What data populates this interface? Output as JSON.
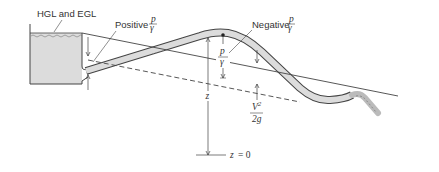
{
  "diagram": {
    "type": "siphon-hgl-egl",
    "colors": {
      "line": "#444444",
      "fluid_fill": "#dcdcdc",
      "background": "#ffffff"
    },
    "labels": {
      "hgl_egl": "HGL and EGL",
      "positive": "Positive",
      "negative": "Negative",
      "p": "p",
      "gamma": "γ",
      "z": "z",
      "v2": "V",
      "v2_exp": "2",
      "two_g": "2g",
      "datum": "z = 0"
    }
  }
}
